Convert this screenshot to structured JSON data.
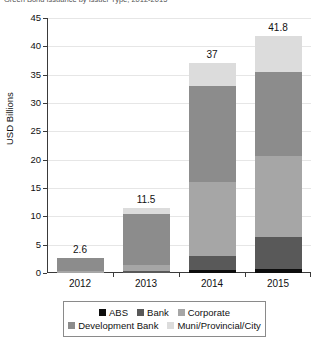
{
  "chart_data": {
    "type": "bar",
    "subtype": "stacked-bar",
    "title": "Green Bond Issuance by Issuer Type, 2012-2015",
    "xlabel": "",
    "ylabel": "USD Billions",
    "ylim": [
      0,
      45
    ],
    "yticks": [
      0,
      5,
      10,
      15,
      20,
      25,
      30,
      35,
      40,
      45
    ],
    "ytick_labels": [
      "0",
      "5",
      "10",
      "15",
      "20",
      "25",
      "30",
      "35",
      "40",
      "45"
    ],
    "grid": true,
    "legend_position": "bottom",
    "categories": [
      "2012",
      "2013",
      "2014",
      "2015"
    ],
    "totals": [
      2.6,
      11.5,
      37,
      41.8
    ],
    "total_labels": [
      "2.6",
      "11.5",
      "37",
      "41.8"
    ],
    "series": [
      {
        "name": "ABS",
        "color": "#0d0d0d",
        "values": [
          0.0,
          0.0,
          0.6,
          0.7
        ]
      },
      {
        "name": "Bank",
        "color": "#595959",
        "values": [
          0.0,
          0.3,
          2.4,
          5.6
        ]
      },
      {
        "name": "Corporate",
        "color": "#a6a6a6",
        "values": [
          0.3,
          1.2,
          13.0,
          14.3
        ]
      },
      {
        "name": "Development Bank",
        "color": "#8c8c8c",
        "values": [
          2.3,
          9.0,
          17.0,
          14.9
        ]
      },
      {
        "name": "Muni/Provincial/City",
        "color": "#dcdcdc",
        "values": [
          0.0,
          1.0,
          4.0,
          6.3
        ]
      }
    ]
  },
  "legend": {
    "rows": [
      [
        {
          "label": "ABS",
          "color": "#0d0d0d"
        },
        {
          "label": "Bank",
          "color": "#595959"
        },
        {
          "label": "Corporate",
          "color": "#a6a6a6"
        }
      ],
      [
        {
          "label": "Development Bank",
          "color": "#8c8c8c"
        },
        {
          "label": "Muni/Provincial/City",
          "color": "#dcdcdc"
        }
      ]
    ]
  }
}
